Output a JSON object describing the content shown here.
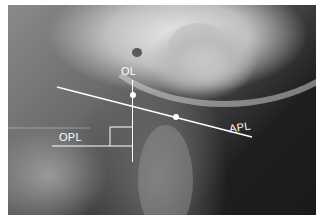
{
  "figure": {
    "labels": {
      "ol": "OL",
      "apl": "APL",
      "opl": "OPL"
    },
    "colors": {
      "annotation": "#ffffff",
      "border": "#ffffff"
    }
  }
}
